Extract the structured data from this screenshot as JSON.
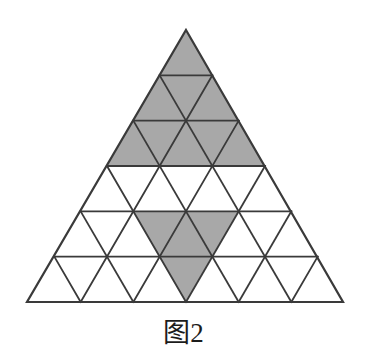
{
  "figure": {
    "caption": "图2",
    "title": "图2",
    "type": "triangular-grid-shading-diagram"
  },
  "geometry": {
    "apex_x": 186,
    "apex_y": 30,
    "base_left_x": 27,
    "base_right_x": 343,
    "base_y": 302,
    "rows": 6,
    "total_small_triangles": 36,
    "upward_triangles": 21,
    "downward_triangles": 15
  },
  "colors": {
    "shaded_fill": "#a8a8a8",
    "unshaded_fill": "#ffffff",
    "stroke": "#3a3a3a",
    "background": "#ffffff",
    "caption_text": "#1c1c1c"
  },
  "style": {
    "stroke_width": 1.8,
    "outer_stroke_width": 2.2
  },
  "chart_data": {
    "type": "diagram",
    "title": "图2",
    "rows": [
      {
        "row": 1,
        "cells": [
          {
            "index": 0,
            "orientation": "up",
            "shaded": true
          }
        ]
      },
      {
        "row": 2,
        "cells": [
          {
            "index": 0,
            "orientation": "up",
            "shaded": true
          },
          {
            "index": 1,
            "orientation": "down",
            "shaded": true
          },
          {
            "index": 2,
            "orientation": "up",
            "shaded": true
          }
        ]
      },
      {
        "row": 3,
        "cells": [
          {
            "index": 0,
            "orientation": "up",
            "shaded": true
          },
          {
            "index": 1,
            "orientation": "down",
            "shaded": true
          },
          {
            "index": 2,
            "orientation": "up",
            "shaded": true
          },
          {
            "index": 3,
            "orientation": "down",
            "shaded": true
          },
          {
            "index": 4,
            "orientation": "up",
            "shaded": true
          }
        ]
      },
      {
        "row": 4,
        "cells": [
          {
            "index": 0,
            "orientation": "up",
            "shaded": false
          },
          {
            "index": 1,
            "orientation": "down",
            "shaded": false
          },
          {
            "index": 2,
            "orientation": "up",
            "shaded": false
          },
          {
            "index": 3,
            "orientation": "down",
            "shaded": false
          },
          {
            "index": 4,
            "orientation": "up",
            "shaded": false
          },
          {
            "index": 5,
            "orientation": "down",
            "shaded": false
          },
          {
            "index": 6,
            "orientation": "up",
            "shaded": false
          }
        ]
      },
      {
        "row": 5,
        "cells": [
          {
            "index": 0,
            "orientation": "up",
            "shaded": false
          },
          {
            "index": 1,
            "orientation": "down",
            "shaded": false
          },
          {
            "index": 2,
            "orientation": "up",
            "shaded": false
          },
          {
            "index": 3,
            "orientation": "down",
            "shaded": true
          },
          {
            "index": 4,
            "orientation": "up",
            "shaded": true
          },
          {
            "index": 5,
            "orientation": "down",
            "shaded": true
          },
          {
            "index": 6,
            "orientation": "up",
            "shaded": false
          },
          {
            "index": 7,
            "orientation": "down",
            "shaded": false
          },
          {
            "index": 8,
            "orientation": "up",
            "shaded": false
          }
        ]
      },
      {
        "row": 6,
        "cells": [
          {
            "index": 0,
            "orientation": "up",
            "shaded": false
          },
          {
            "index": 1,
            "orientation": "down",
            "shaded": false
          },
          {
            "index": 2,
            "orientation": "up",
            "shaded": false
          },
          {
            "index": 3,
            "orientation": "down",
            "shaded": false
          },
          {
            "index": 4,
            "orientation": "up",
            "shaded": false
          },
          {
            "index": 5,
            "orientation": "down",
            "shaded": true
          },
          {
            "index": 6,
            "orientation": "up",
            "shaded": false
          },
          {
            "index": 7,
            "orientation": "down",
            "shaded": false
          },
          {
            "index": 8,
            "orientation": "up",
            "shaded": false
          },
          {
            "index": 9,
            "orientation": "down",
            "shaded": false
          },
          {
            "index": 10,
            "orientation": "up",
            "shaded": false
          }
        ]
      }
    ],
    "shaded_count": 13,
    "unshaded_count": 23
  }
}
